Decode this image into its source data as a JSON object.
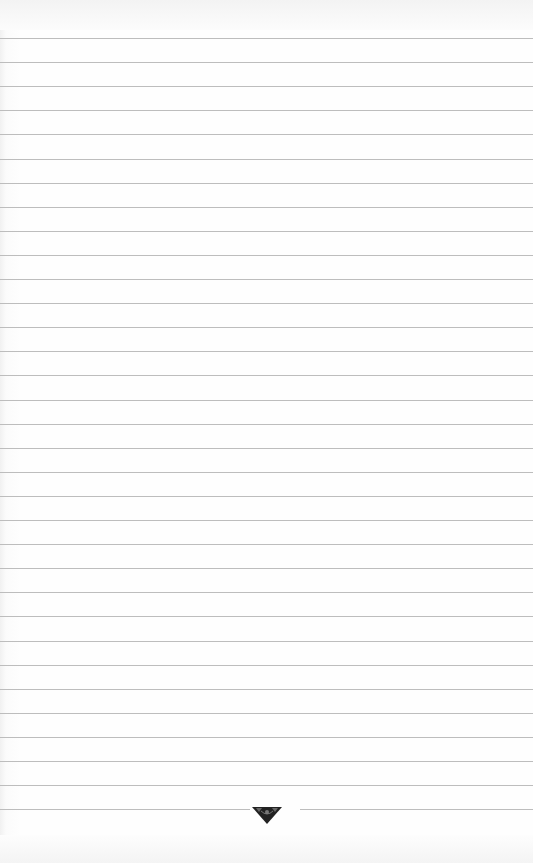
{
  "page": {
    "type": "ruled-paper",
    "background_color": "#fdfdfd",
    "rule_color": "#bdbdbd",
    "rule_count": 33,
    "rule_first_y": 38,
    "rule_spacing": 24.1
  },
  "ornament": {
    "icon": "inverted-triangle-ornament-icon",
    "color": "#222222"
  }
}
